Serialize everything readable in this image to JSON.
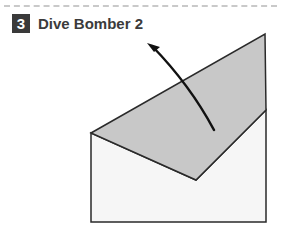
{
  "step": {
    "number": "3",
    "title": "Dive Bomber 2"
  },
  "colors": {
    "badge_bg": "#3a3a3a",
    "folded_flap": "#c8c8c8",
    "paper": "#f6f6f6",
    "outline": "#2a2a2a",
    "arrow": "#111111"
  }
}
